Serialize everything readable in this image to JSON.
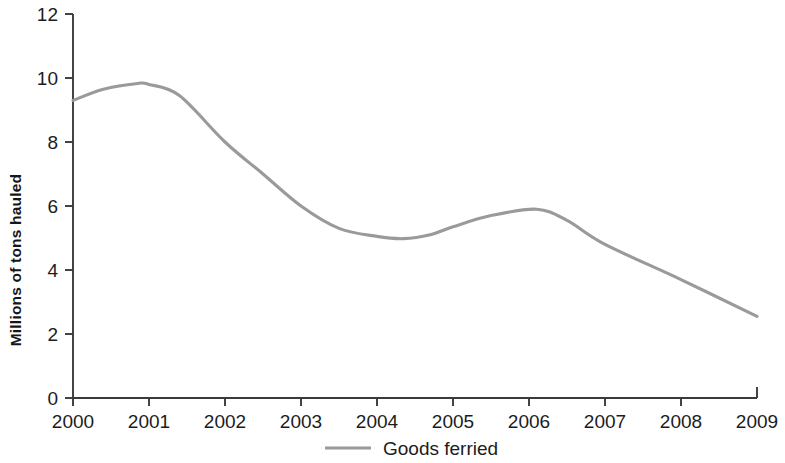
{
  "chart_data": {
    "type": "line",
    "title": "",
    "subtitle": "",
    "xlabel": "",
    "ylabel": "Millions of tons hauled",
    "x": [
      2000,
      2001,
      2002,
      2003,
      2004,
      2005,
      2006,
      2007,
      2008,
      2009
    ],
    "categories": [
      "2000",
      "2001",
      "2002",
      "2003",
      "2004",
      "2005",
      "2006",
      "2007",
      "2008",
      "2009"
    ],
    "series": [
      {
        "name": "Goods ferried",
        "color": "#9a9a9a",
        "values": [
          9.3,
          9.8,
          8.0,
          6.0,
          5.05,
          5.35,
          5.9,
          4.8,
          3.7,
          2.55
        ]
      }
    ],
    "smoothed_points": [
      {
        "x": 2000.0,
        "y": 9.3
      },
      {
        "x": 2000.4,
        "y": 9.65
      },
      {
        "x": 2000.85,
        "y": 9.83
      },
      {
        "x": 2001.0,
        "y": 9.8
      },
      {
        "x": 2001.4,
        "y": 9.45
      },
      {
        "x": 2002.0,
        "y": 8.0
      },
      {
        "x": 2002.5,
        "y": 7.0
      },
      {
        "x": 2003.0,
        "y": 6.0
      },
      {
        "x": 2003.5,
        "y": 5.3
      },
      {
        "x": 2004.0,
        "y": 5.05
      },
      {
        "x": 2004.35,
        "y": 4.98
      },
      {
        "x": 2004.7,
        "y": 5.1
      },
      {
        "x": 2005.0,
        "y": 5.35
      },
      {
        "x": 2005.5,
        "y": 5.7
      },
      {
        "x": 2006.1,
        "y": 5.9
      },
      {
        "x": 2006.5,
        "y": 5.55
      },
      {
        "x": 2007.0,
        "y": 4.8
      },
      {
        "x": 2008.0,
        "y": 3.7
      },
      {
        "x": 2009.0,
        "y": 2.55
      }
    ],
    "xlim": [
      2000,
      2009
    ],
    "ylim": [
      0,
      12
    ],
    "ytick_labels": [
      "0",
      "2",
      "4",
      "6",
      "8",
      "10",
      "12"
    ],
    "yticks": [
      0,
      2,
      4,
      6,
      8,
      10,
      12
    ],
    "grid": false,
    "legend_position": "bottom-center",
    "legend": [
      {
        "label": "Goods ferried",
        "color": "#9a9a9a",
        "marker": "line"
      }
    ],
    "axis_color": "#3a3a3a"
  }
}
